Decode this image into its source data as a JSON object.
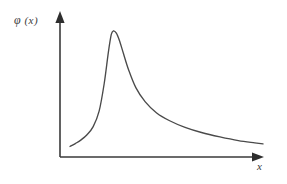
{
  "figure": {
    "background_color": "#ffffff",
    "stroke_color": "#4a4a4a",
    "axis_color": "#3a3a3a"
  },
  "y_axis": {
    "label_symbol": "φ",
    "label_arg": "(x)",
    "label_full": "φ (x)",
    "arrow": "up-arrowhead"
  },
  "x_axis": {
    "label": "x",
    "arrow": "right-arrowhead"
  },
  "chart_data": {
    "type": "line",
    "title": "",
    "subtitle": "",
    "xlabel": "x",
    "ylabel": "φ (x)",
    "grid": false,
    "legend": null,
    "axis_arrows": true,
    "tick_labels": {
      "x": [],
      "y": []
    },
    "xlim": [
      0,
      1
    ],
    "ylim": [
      0,
      1
    ],
    "series": [
      {
        "name": "phi(x)",
        "color": "#4a4a4a",
        "x": [
          0.059,
          0.085,
          0.113,
          0.142,
          0.172,
          0.201,
          0.226,
          0.246,
          0.26,
          0.27,
          0.285,
          0.3,
          0.32,
          0.345,
          0.38,
          0.425,
          0.48,
          0.545,
          0.62,
          0.7,
          0.79,
          0.88,
          0.96,
          1.0
        ],
        "y": [
          0.09,
          0.11,
          0.135,
          0.17,
          0.225,
          0.33,
          0.52,
          0.73,
          0.85,
          0.875,
          0.86,
          0.81,
          0.72,
          0.61,
          0.49,
          0.395,
          0.32,
          0.265,
          0.22,
          0.185,
          0.155,
          0.13,
          0.115,
          0.108
        ]
      }
    ]
  }
}
